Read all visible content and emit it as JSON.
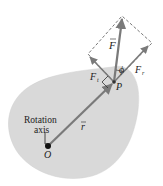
{
  "diagram": {
    "labels": {
      "force": "F",
      "force_tangential": "F",
      "force_tangential_sub": "t",
      "force_radial": "F",
      "force_radial_sub": "r",
      "angle": "ϕ",
      "point": "P",
      "position_vector": "r",
      "origin": "O",
      "axis_line1": "Rotation",
      "axis_line2": "axis"
    },
    "colors": {
      "body_fill": "#d9d9d9",
      "vector": "#6d6d6d",
      "dashed": "#555555",
      "text": "#222222"
    }
  }
}
